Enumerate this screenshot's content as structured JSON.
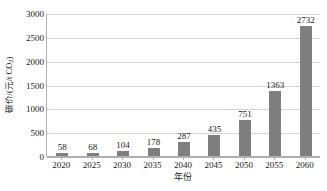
{
  "chart_data": {
    "type": "bar",
    "title": "",
    "subtitle": "",
    "xlabel": "年份",
    "ylabel": "碳价/(元/t CO2)",
    "ylabel_main": "碳价/(元/t CO",
    "ylabel_sub": "2",
    "ylabel_tail": ")",
    "categories": [
      "2020",
      "2025",
      "2030",
      "2035",
      "2040",
      "2045",
      "2050",
      "2055",
      "2060"
    ],
    "values": [
      58,
      68,
      104,
      178,
      287,
      435,
      751,
      1363,
      2732
    ],
    "value_labels": [
      "58",
      "68",
      "104",
      "178",
      "287",
      "435",
      "751",
      "1363",
      "2732"
    ],
    "ylim": [
      0,
      3000
    ],
    "ytick_labels": [
      "0",
      "500",
      "1000",
      "1500",
      "2000",
      "2500",
      "3000"
    ],
    "ytick_values": [
      0,
      500,
      1000,
      1500,
      2000,
      2500,
      3000
    ],
    "grid": true,
    "grid_axis": "y",
    "legend": false,
    "legend_position": "none",
    "series": [
      {
        "name": "碳价",
        "color": "#7f7f7f",
        "values": [
          58,
          68,
          104,
          178,
          287,
          435,
          751,
          1363,
          2732
        ]
      }
    ],
    "colors": {
      "bar": "#7f7f7f",
      "grid": "#d4d4d4",
      "axis": "#b0b0b0",
      "text": "#1a1a1a",
      "background": "#ffffff"
    }
  }
}
